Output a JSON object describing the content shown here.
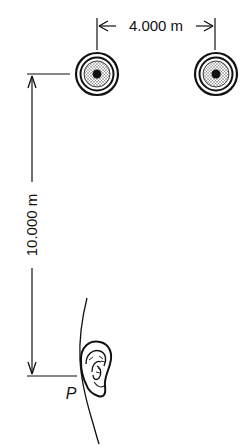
{
  "diagram": {
    "type": "acoustics-geometry",
    "colors": {
      "ink": "#111111",
      "speaker_fill": "#bdbdbd",
      "background": "#ffffff"
    },
    "speakers": [
      {
        "id": "left",
        "label": "speaker-left",
        "cx": 97,
        "cy": 74
      },
      {
        "id": "right",
        "label": "speaker-right",
        "cx": 216,
        "cy": 74
      }
    ],
    "horizontal_dimension": {
      "label": "4.000 m",
      "between": [
        "left",
        "right"
      ]
    },
    "vertical_dimension": {
      "label": "10.000 m",
      "from": "left speaker",
      "to": "P"
    },
    "listener": {
      "point_label": "P",
      "depiction": "ear"
    }
  }
}
